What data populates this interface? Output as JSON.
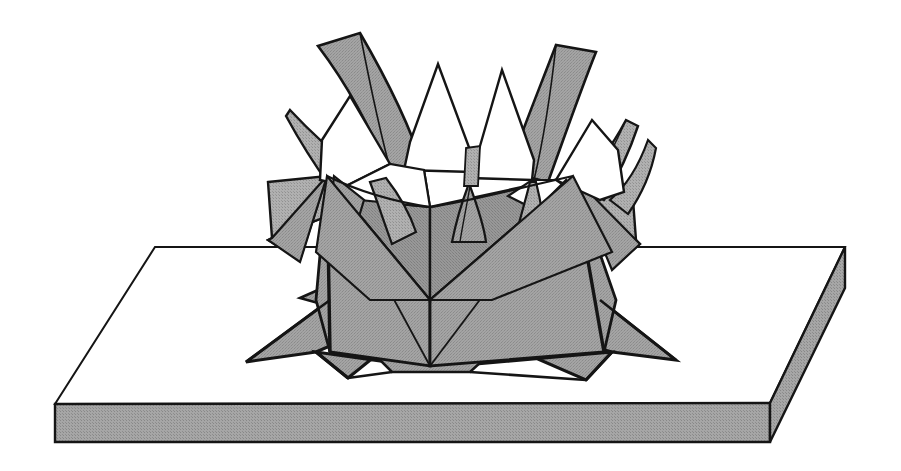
{
  "figure": {
    "style": "black-and-white technical line drawing, halftone gray shading",
    "canvas": {
      "width": 901,
      "height": 471
    },
    "background_color": "#ffffff"
  },
  "colors": {
    "paper_light": "#a8a8a8",
    "paper_mid": "#9b9b9b",
    "paper_dark": "#8c8c8c",
    "paper_white": "#ffffff",
    "slab_top": "#ffffff",
    "slab_edge": "#9b9b9b",
    "outline": "#111111",
    "outline_thin": "#1a1a1a"
  },
  "parts": {
    "base": {
      "name": "display slab",
      "top_face_label": "slab-top-face",
      "front_edge_label": "slab-front-edge",
      "right_edge_label": "slab-right-edge"
    },
    "body": {
      "name": "folded cup body",
      "petal_count_outer": 8,
      "petal_count_inner": 6,
      "skirt_points": 6
    }
  },
  "geometry": {
    "slab": {
      "top": [
        [
          155,
          247
        ],
        [
          845,
          247
        ],
        [
          770,
          403
        ],
        [
          55,
          404
        ]
      ],
      "front": [
        [
          55,
          404
        ],
        [
          770,
          403
        ],
        [
          770,
          442
        ],
        [
          55,
          442
        ]
      ],
      "right": [
        [
          770,
          403
        ],
        [
          845,
          247
        ],
        [
          845,
          288
        ],
        [
          770,
          442
        ]
      ]
    },
    "skirt": [
      [
        [
          305,
          300
        ],
        [
          375,
          268
        ],
        [
          430,
          300
        ],
        [
          372,
          333
        ]
      ],
      [
        [
          330,
          335
        ],
        [
          430,
          300
        ],
        [
          430,
          370
        ],
        [
          318,
          352
        ]
      ],
      [
        [
          430,
          300
        ],
        [
          530,
          268
        ],
        [
          596,
          300
        ],
        [
          530,
          333
        ]
      ],
      [
        [
          430,
          300
        ],
        [
          530,
          333
        ],
        [
          520,
          375
        ],
        [
          430,
          370
        ]
      ],
      [
        [
          596,
          300
        ],
        [
          640,
          330
        ],
        [
          596,
          352
        ],
        [
          530,
          333
        ]
      ]
    ],
    "cup": {
      "left_panel": [
        [
          327,
          176
        ],
        [
          430,
          300
        ],
        [
          430,
          358
        ],
        [
          327,
          352
        ]
      ],
      "right_panel": [
        [
          573,
          176
        ],
        [
          430,
          300
        ],
        [
          430,
          358
        ],
        [
          573,
          352
        ]
      ],
      "rim_v": [
        [
          327,
          176
        ],
        [
          430,
          207
        ],
        [
          573,
          176
        ],
        [
          430,
          300
        ]
      ]
    },
    "petals_outer": [
      {
        "tip": [
          360,
          33
        ],
        "base_l": [
          318,
          140
        ],
        "base_r": [
          410,
          165
        ],
        "tone": "mid"
      },
      {
        "tip": [
          293,
          112
        ],
        "base_l": [
          268,
          182
        ],
        "base_r": [
          345,
          175
        ],
        "tone": "white"
      },
      {
        "tip": [
          268,
          182
        ],
        "base_l": [
          268,
          238
        ],
        "base_r": [
          330,
          215
        ],
        "tone": "light"
      },
      {
        "tip": [
          556,
          47
        ],
        "base_l": [
          500,
          160
        ],
        "base_r": [
          600,
          150
        ],
        "tone": "mid"
      },
      {
        "tip": [
          620,
          120
        ],
        "base_l": [
          580,
          180
        ],
        "base_r": [
          640,
          186
        ],
        "tone": "white"
      },
      {
        "tip": [
          632,
          186
        ],
        "base_l": [
          596,
          220
        ],
        "base_r": [
          632,
          240
        ],
        "tone": "light"
      }
    ],
    "petals_inner": [
      {
        "tip": [
          408,
          62
        ],
        "base_l": [
          370,
          160
        ],
        "base_r": [
          440,
          160
        ]
      },
      {
        "tip": [
          487,
          62
        ],
        "base_l": [
          455,
          165
        ],
        "base_r": [
          520,
          165
        ]
      },
      {
        "tip": [
          345,
          100
        ],
        "base_l": [
          320,
          180
        ],
        "base_r": [
          380,
          175
        ]
      },
      {
        "tip": [
          540,
          100
        ],
        "base_l": [
          512,
          178
        ],
        "base_r": [
          566,
          180
        ]
      }
    ]
  },
  "annotations": {
    "visible_text": [],
    "caption": ""
  }
}
